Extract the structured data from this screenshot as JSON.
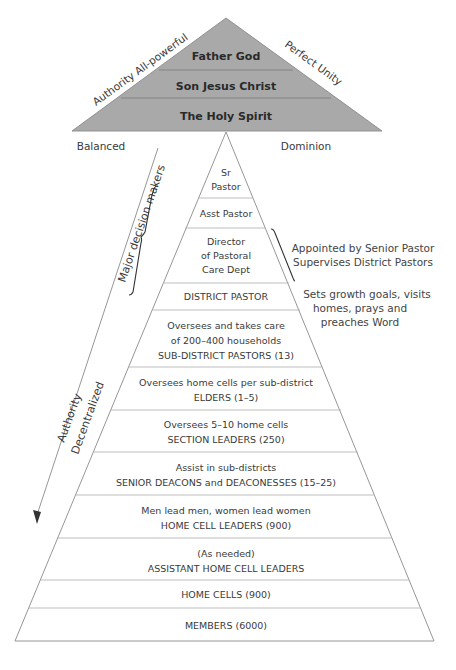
{
  "top_pyramid": {
    "fill_color": "#a9a9a9",
    "levels": [
      "Father God",
      "Son Jesus Christ",
      "The Holy Spirit"
    ],
    "left_label": "Authority All-powerful",
    "right_label": "Perfect Unity"
  },
  "side_labels": {
    "left": "Balanced",
    "right": "Dominion"
  },
  "diagonal_labels": {
    "major_decision_makers": "Major decision makers",
    "authority": "Authority",
    "decentralized": "Decentralized"
  },
  "notes": {
    "director": [
      "Appointed by Senior Pastor",
      "Supervises District Pastors"
    ],
    "district_pastor": [
      "Sets growth goals, visits",
      "homes, prays and",
      "preaches Word"
    ]
  },
  "lower_pyramid": {
    "levels": [
      {
        "lines": [
          "Sr",
          "Pastor"
        ]
      },
      {
        "lines": [
          "Asst Pastor"
        ]
      },
      {
        "lines": [
          "Director",
          "of Pastoral",
          "Care Dept"
        ]
      },
      {
        "lines": [
          "DISTRICT PASTOR"
        ]
      },
      {
        "lines": [
          "Oversees and takes care",
          "of 200–400 households",
          "SUB-DISTRICT PASTORS (13)"
        ]
      },
      {
        "lines": [
          "Oversees home cells per sub-district",
          "ELDERS (1–5)"
        ]
      },
      {
        "lines": [
          "Oversees 5–10 home cells",
          "SECTION LEADERS (250)"
        ]
      },
      {
        "lines": [
          "Assist in sub-districts",
          "SENIOR DEACONS and DEACONESSES (15–25)"
        ]
      },
      {
        "lines": [
          "Men lead men, women lead women",
          "HOME CELL LEADERS (900)"
        ]
      },
      {
        "lines": [
          "(As needed)",
          "ASSISTANT HOME CELL LEADERS"
        ]
      },
      {
        "lines": [
          "HOME CELLS (900)"
        ]
      },
      {
        "lines": [
          "MEMBERS (6000)"
        ]
      }
    ]
  }
}
